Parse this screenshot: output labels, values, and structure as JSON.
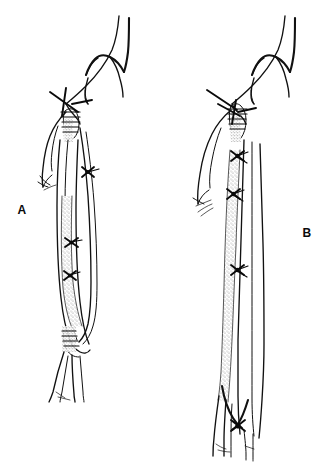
{
  "figure": {
    "background_color": "#ffffff",
    "ink_color": "#111111",
    "stipple_color": "#9a9a9a",
    "width": 331,
    "height": 463,
    "style": "black-and-white medical line drawing"
  },
  "panels": [
    {
      "id": "A",
      "label": "A",
      "label_x": 22,
      "label_y": 214,
      "caption": "Reversed saphenous vein femoropopliteal bypass graft",
      "graft_description": "Shaded (stippled) reversed vein graft segment occupying the mid portion of the conduit",
      "anastomoses": [
        "proximal femoral anastomosis",
        "distal popliteal anastomosis"
      ],
      "ligature_marks": 3
    },
    {
      "id": "B",
      "label": "B",
      "label_x": 303,
      "label_y": 237,
      "caption": "In situ saphenous vein femoropopliteal bypass graft",
      "graft_description": "Long stippled in-situ vein conduit extending the full length of the thigh to the distal anastomosis",
      "anastomoses": [
        "proximal femoral anastomosis",
        "distal popliteal anastomosis"
      ],
      "ligature_marks": 3
    }
  ],
  "annotations": {
    "suture_symbol": "x-ligature-mark",
    "graft_symbol": "stippled-vein-graft",
    "artery_symbol": "outlined-artery"
  }
}
